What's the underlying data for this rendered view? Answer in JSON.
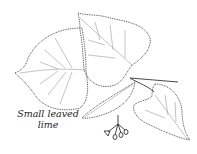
{
  "illustration": {
    "subject": "small-leaved lime botanical line drawing",
    "caption_line1": "Small leaved",
    "caption_line2": "lime",
    "colors": {
      "background": "#ffffff",
      "ink": "#333333",
      "vein": "#888888"
    }
  }
}
